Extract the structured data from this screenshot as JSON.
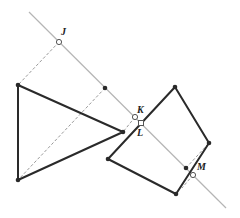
{
  "diagram": {
    "mirror_line": {
      "x1": 29,
      "y1": 12,
      "x2": 226,
      "y2": 208,
      "color": "#b5b5b5"
    },
    "triangle": {
      "points": [
        [
          18,
          85
        ],
        [
          123,
          132
        ],
        [
          18,
          180
        ]
      ],
      "color": "#2a2a2a"
    },
    "quadrilateral": {
      "points": [
        [
          175,
          87
        ],
        [
          209,
          143
        ],
        [
          176,
          194
        ],
        [
          108,
          159
        ]
      ],
      "color": "#2a2a2a"
    },
    "dashed_lines": [
      {
        "x1": 59,
        "y1": 42,
        "x2": 18,
        "y2": 85
      },
      {
        "x1": 105,
        "y1": 88,
        "x2": 18,
        "y2": 180
      },
      {
        "x1": 135,
        "y1": 117,
        "x2": 123,
        "y2": 132
      },
      {
        "x1": 186,
        "y1": 168,
        "x2": 209,
        "y2": 143
      },
      {
        "x1": 193,
        "y1": 175,
        "x2": 182,
        "y2": 188
      }
    ],
    "filled_points": [
      [
        105,
        88
      ],
      [
        186,
        168
      ]
    ],
    "labels": [
      {
        "name": "J",
        "text": "J",
        "x": 61,
        "y": 35,
        "marker": "circle",
        "mx": 59,
        "my": 42
      },
      {
        "name": "K",
        "text": "K",
        "x": 137,
        "y": 113,
        "marker": "circle",
        "mx": 135,
        "my": 117
      },
      {
        "name": "L",
        "text": "L",
        "x": 137,
        "y": 136,
        "marker": "square",
        "mx": 141,
        "my": 123
      },
      {
        "name": "M",
        "text": "M",
        "x": 197,
        "y": 170,
        "marker": "circle",
        "mx": 193,
        "my": 175
      }
    ]
  }
}
